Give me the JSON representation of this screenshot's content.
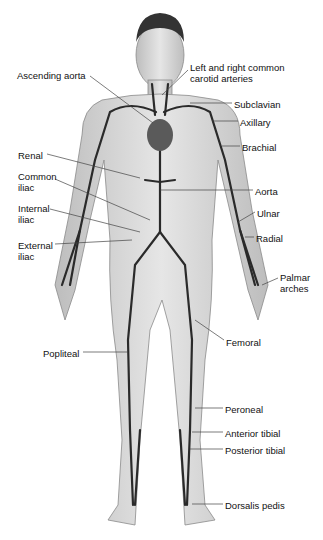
{
  "diagram": {
    "labels": [
      {
        "id": "ascending-aorta",
        "text": "Ascending aorta",
        "x": 17,
        "y": 70
      },
      {
        "id": "carotid-1",
        "text": "Left and right common",
        "x": 190,
        "y": 62
      },
      {
        "id": "carotid-2",
        "text": "carotid arteries",
        "x": 190,
        "y": 73
      },
      {
        "id": "subclavian",
        "text": "Subclavian",
        "x": 234,
        "y": 99
      },
      {
        "id": "axillary",
        "text": "Axillary",
        "x": 240,
        "y": 117
      },
      {
        "id": "brachial",
        "text": "Brachial",
        "x": 242,
        "y": 142
      },
      {
        "id": "renal",
        "text": "Renal",
        "x": 18,
        "y": 150
      },
      {
        "id": "common-iliac-1",
        "text": "Common",
        "x": 18,
        "y": 171
      },
      {
        "id": "common-iliac-2",
        "text": "iliac",
        "x": 18,
        "y": 182
      },
      {
        "id": "aorta",
        "text": "Aorta",
        "x": 255,
        "y": 186
      },
      {
        "id": "internal-iliac-1",
        "text": "Internal",
        "x": 18,
        "y": 203
      },
      {
        "id": "internal-iliac-2",
        "text": "iliac",
        "x": 18,
        "y": 214
      },
      {
        "id": "ulnar",
        "text": "Ulnar",
        "x": 257,
        "y": 208
      },
      {
        "id": "radial",
        "text": "Radial",
        "x": 256,
        "y": 233
      },
      {
        "id": "external-iliac-1",
        "text": "External",
        "x": 18,
        "y": 240
      },
      {
        "id": "external-iliac-2",
        "text": "iliac",
        "x": 18,
        "y": 251
      },
      {
        "id": "palmar-1",
        "text": "Palmar",
        "x": 280,
        "y": 272
      },
      {
        "id": "palmar-2",
        "text": "arches",
        "x": 280,
        "y": 283
      },
      {
        "id": "femoral",
        "text": "Femoral",
        "x": 226,
        "y": 337
      },
      {
        "id": "popliteal",
        "text": "Popliteal",
        "x": 43,
        "y": 348
      },
      {
        "id": "peroneal",
        "text": "Peroneal",
        "x": 225,
        "y": 404
      },
      {
        "id": "anterior-tibial",
        "text": "Anterior tibial",
        "x": 225,
        "y": 428
      },
      {
        "id": "posterior-tibial",
        "text": "Posterior tibial",
        "x": 225,
        "y": 445
      },
      {
        "id": "dorsalis-pedis",
        "text": "Dorsalis pedis",
        "x": 225,
        "y": 500
      }
    ],
    "colors": {
      "skin": "#d9d9d9",
      "skin_shade": "#b8b8b8",
      "artery": "#2a2a2a",
      "heart": "#5a5a5a",
      "hair": "#333333",
      "leader": "#444444"
    }
  }
}
